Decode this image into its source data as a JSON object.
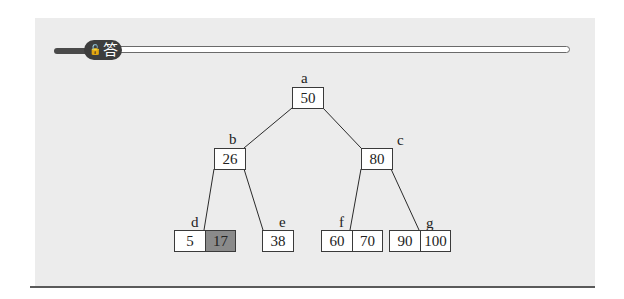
{
  "header": {
    "badge_icon": "lock-icon",
    "badge_icon_glyph": "🔓",
    "badge_label": "答"
  },
  "tree": {
    "edge_color": "#2a2a2a",
    "highlight_color": "#8a8a8a",
    "nodes": [
      {
        "id": "a",
        "label": "a",
        "keys": [
          "50"
        ],
        "highlight": []
      },
      {
        "id": "b",
        "label": "b",
        "keys": [
          "26"
        ],
        "highlight": []
      },
      {
        "id": "c",
        "label": "c",
        "keys": [
          "80"
        ],
        "highlight": []
      },
      {
        "id": "d",
        "label": "d",
        "keys": [
          "5",
          "17"
        ],
        "highlight": [
          "17"
        ]
      },
      {
        "id": "e",
        "label": "e",
        "keys": [
          "38"
        ],
        "highlight": []
      },
      {
        "id": "f",
        "label": "f",
        "keys": [
          "60",
          "70"
        ],
        "highlight": []
      },
      {
        "id": "g",
        "label": "g",
        "keys": [
          "90",
          "100"
        ],
        "highlight": []
      }
    ],
    "edges": [
      [
        "a",
        "b"
      ],
      [
        "a",
        "c"
      ],
      [
        "b",
        "d"
      ],
      [
        "b",
        "e"
      ],
      [
        "c",
        "f"
      ],
      [
        "c",
        "g"
      ]
    ]
  }
}
